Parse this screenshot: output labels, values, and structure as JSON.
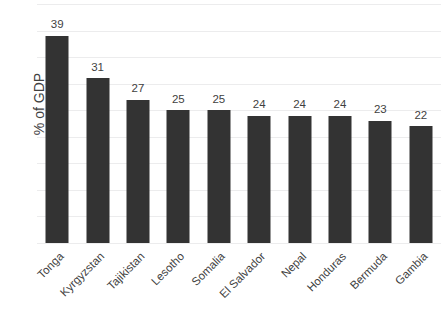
{
  "chart_data": {
    "type": "bar",
    "title": "",
    "subtitle": "",
    "xlabel": "",
    "ylabel": "% of GDP",
    "categories": [
      "Tonga",
      "Kyrgyzstan",
      "Tajikistan",
      "Lesotho",
      "Somalia",
      "El Salvador",
      "Nepal",
      "Honduras",
      "Bermuda",
      "Gambia"
    ],
    "values": [
      39,
      31,
      27,
      25,
      25,
      24,
      24,
      24,
      23,
      22
    ],
    "data_labels": [
      "39",
      "31",
      "27",
      "25",
      "25",
      "24",
      "24",
      "24",
      "23",
      "22"
    ],
    "ylim": [
      0,
      45
    ],
    "grid": true,
    "grid_step": 5,
    "gridline_count": 9,
    "y_tick_labels": [],
    "legend": false,
    "legend_position": "none",
    "bar_color": "#333333",
    "gridline_color": "#ececed",
    "text_color": "#3f3f3f",
    "background_color": "#ffffff",
    "x_label_rotation_degrees": -45
  }
}
